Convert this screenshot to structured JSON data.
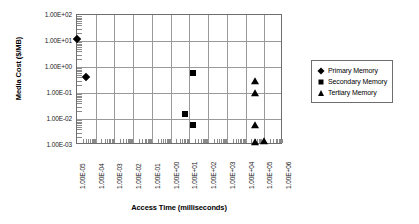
{
  "chart_data": {
    "type": "scatter",
    "title": "",
    "xlabel": "Access Time (milliseconds)",
    "ylabel": "Media Cost ($/MB)",
    "xscale": "log",
    "yscale": "log",
    "xlim": [
      1e-05,
      1000000.0
    ],
    "ylim": [
      0.001,
      100.0
    ],
    "grid": true,
    "legend_position": "right",
    "xticklabels": [
      "1.00E-05",
      "1.00E-04",
      "1.00E-03",
      "1.00E-02",
      "1.00E-01",
      "1.00E+00",
      "1.00E+01",
      "1.00E+02",
      "1.00E+03",
      "1.00E+04",
      "1.00E+05",
      "1.00E+06"
    ],
    "yticklabels": [
      "1.00E+02",
      "1.00E+01",
      "1.00E+00",
      "1.00E-01",
      "1.00E-02",
      "1.00E-03"
    ],
    "series": [
      {
        "name": "Primary Memory",
        "marker": "diamond",
        "color": "#000000",
        "points": [
          {
            "x": 1e-05,
            "y": 12.0
          },
          {
            "x": 3e-05,
            "y": 0.42
          }
        ]
      },
      {
        "name": "Secondary Memory",
        "marker": "square",
        "color": "#000000",
        "points": [
          {
            "x": 16.0,
            "y": 0.6
          },
          {
            "x": 6.0,
            "y": 0.015
          },
          {
            "x": 16.0,
            "y": 0.006
          }
        ]
      },
      {
        "name": "Tertiary Memory",
        "marker": "triangle",
        "color": "#000000",
        "points": [
          {
            "x": 30000.0,
            "y": 0.3
          },
          {
            "x": 30000.0,
            "y": 0.1
          },
          {
            "x": 30000.0,
            "y": 0.006
          },
          {
            "x": 30000.0,
            "y": 0.0013
          },
          {
            "x": 100000.0,
            "y": 0.0014
          }
        ]
      }
    ]
  },
  "legend": {
    "items": [
      {
        "label": "Primary Memory",
        "marker": "diamond"
      },
      {
        "label": "Secondary Memory",
        "marker": "square"
      },
      {
        "label": "Tertiary Memory",
        "marker": "triangle"
      }
    ]
  },
  "axes": {
    "x_title": "Access Time (milliseconds)",
    "y_title": "Media Cost ($/MB)"
  }
}
